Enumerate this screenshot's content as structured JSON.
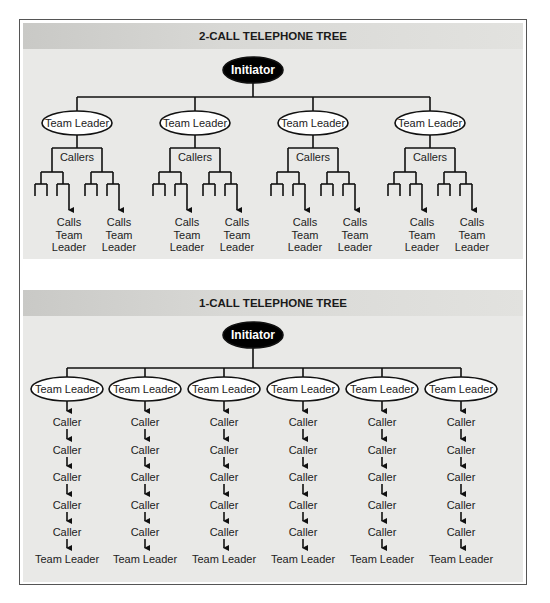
{
  "two_call_tree": {
    "title": "2-CALL TELEPHONE TREE",
    "initiator_label": "Initiator",
    "team_leaders": [
      {
        "label": "Team Leader",
        "callers_label": "Callers",
        "outcome_labels": [
          [
            "Calls",
            "Team",
            "Leader"
          ],
          [
            "Calls",
            "Team",
            "Leader"
          ]
        ]
      },
      {
        "label": "Team Leader",
        "callers_label": "Callers",
        "outcome_labels": [
          [
            "Calls",
            "Team",
            "Leader"
          ],
          [
            "Calls",
            "Team",
            "Leader"
          ]
        ]
      },
      {
        "label": "Team Leader",
        "callers_label": "Callers",
        "outcome_labels": [
          [
            "Calls",
            "Team",
            "Leader"
          ],
          [
            "Calls",
            "Team",
            "Leader"
          ]
        ]
      },
      {
        "label": "Team Leader",
        "callers_label": "Callers",
        "outcome_labels": [
          [
            "Calls",
            "Team",
            "Leader"
          ],
          [
            "Calls",
            "Team",
            "Leader"
          ]
        ]
      }
    ]
  },
  "one_call_tree": {
    "title": "1-CALL TELEPHONE TREE",
    "initiator_label": "Initiator",
    "team_leaders": [
      {
        "label": "Team Leader",
        "chain": [
          "Caller",
          "Caller",
          "Caller",
          "Caller",
          "Caller"
        ],
        "end_label": "Team Leader"
      },
      {
        "label": "Team Leader",
        "chain": [
          "Caller",
          "Caller",
          "Caller",
          "Caller",
          "Caller"
        ],
        "end_label": "Team Leader"
      },
      {
        "label": "Team Leader",
        "chain": [
          "Caller",
          "Caller",
          "Caller",
          "Caller",
          "Caller"
        ],
        "end_label": "Team Leader"
      },
      {
        "label": "Team Leader",
        "chain": [
          "Caller",
          "Caller",
          "Caller",
          "Caller",
          "Caller"
        ],
        "end_label": "Team Leader"
      },
      {
        "label": "Team Leader",
        "chain": [
          "Caller",
          "Caller",
          "Caller",
          "Caller",
          "Caller"
        ],
        "end_label": "Team Leader"
      },
      {
        "label": "Team Leader",
        "chain": [
          "Caller",
          "Caller",
          "Caller",
          "Caller",
          "Caller"
        ],
        "end_label": "Team Leader"
      }
    ]
  },
  "colors": {
    "panel_bg": "#e9e9e7",
    "header_band": "#d3d3d0",
    "initiator_fill": "#000000",
    "initiator_text": "#ffffff",
    "node_fill": "#ffffff",
    "line": "#111111",
    "text": "#222222"
  }
}
